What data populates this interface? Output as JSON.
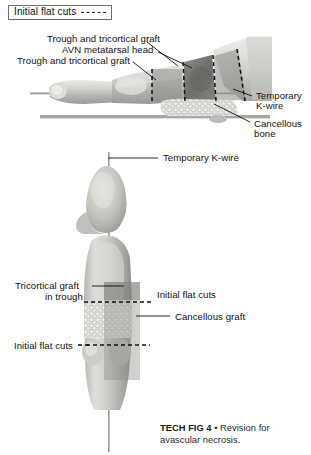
{
  "figure": {
    "legend": {
      "label": "Initial flat cuts",
      "dash_style": "dashed"
    },
    "caption": {
      "prefix": "TECH FIG 4",
      "bullet": "•",
      "text": "Revision for avascular necrosis."
    },
    "top_panel": {
      "labels": [
        {
          "id": "trough-tricortical-graft-upper",
          "text": "Trough and tricortical graft"
        },
        {
          "id": "avn-metatarsal-head",
          "text": "AVN metatarsal head"
        },
        {
          "id": "trough-tricortical-graft-lower",
          "text": "Trough and tricortical graft"
        },
        {
          "id": "temporary-k-wire-line1",
          "text": "Temporary"
        },
        {
          "id": "temporary-k-wire-line2",
          "text": "K-wire"
        },
        {
          "id": "cancellous-bone-line1",
          "text": "Cancellous"
        },
        {
          "id": "cancellous-bone-line2",
          "text": "bone"
        }
      ]
    },
    "bottom_panel": {
      "labels": [
        {
          "id": "temporary-k-wire",
          "text": "Temporary K-wire"
        },
        {
          "id": "tricortical-graft-line1",
          "text": "Tricortical graft"
        },
        {
          "id": "tricortical-graft-line2",
          "text": "in trough"
        },
        {
          "id": "initial-flat-cuts-upper",
          "text": "Initial flat cuts"
        },
        {
          "id": "cancellous-graft",
          "text": "Cancellous graft"
        },
        {
          "id": "initial-flat-cuts-lower",
          "text": "Initial flat cuts"
        }
      ]
    },
    "colors": {
      "background": "#ffffff",
      "ink": "#111111",
      "bone_light": "#d8d8d4",
      "bone_mid": "#b9b9b4",
      "bone_dark": "#9a9a95",
      "graft_overlay": "#8e8e8a",
      "avn_dark": "#6f6f6c",
      "kwire": "#9b9b96",
      "baseline_bar": "#a8a8a3",
      "legend_border": "#6d6d6d"
    }
  }
}
